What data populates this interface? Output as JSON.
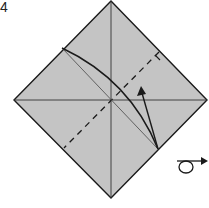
{
  "diagram": {
    "type": "origami-step",
    "step_number": "4",
    "paper_color": "#c4c4c4",
    "line_color": "#1a1a1a",
    "square": {
      "top": [
        111,
        1
      ],
      "right": [
        207,
        100
      ],
      "bottom": [
        111,
        198
      ],
      "left": [
        14,
        100
      ]
    },
    "creases": {
      "horizontal": "existing crease, left corner to right corner",
      "vertical": "existing crease, top corner to bottom corner"
    },
    "valley_fold_line": "dashed line from top-right edge to bottom-left edge",
    "fold_lines": [
      "curved fold line from upper-left edge to lower-right edge",
      "thin straight guide line"
    ],
    "arrow": "fold arrow pointing up-left",
    "symbols": [
      "turn-over"
    ]
  }
}
